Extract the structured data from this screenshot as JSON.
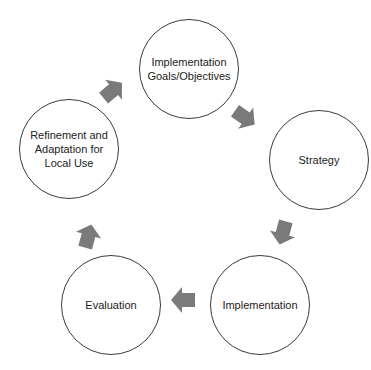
{
  "diagram": {
    "type": "cycle",
    "arrow_color": "#7a7a7a",
    "border_color": "#3a3a3a",
    "nodes": [
      {
        "id": "goals",
        "label": "Implementation\nGoals/Objectives"
      },
      {
        "id": "strategy",
        "label": "Strategy"
      },
      {
        "id": "implementation",
        "label": "Implementation"
      },
      {
        "id": "evaluation",
        "label": "Evaluation"
      },
      {
        "id": "refinement",
        "label": "Refinement and\nAdaptation for\nLocal Use"
      }
    ],
    "edges": [
      {
        "from": "goals",
        "to": "strategy"
      },
      {
        "from": "strategy",
        "to": "implementation"
      },
      {
        "from": "implementation",
        "to": "evaluation"
      },
      {
        "from": "evaluation",
        "to": "refinement"
      },
      {
        "from": "refinement",
        "to": "goals"
      }
    ]
  }
}
